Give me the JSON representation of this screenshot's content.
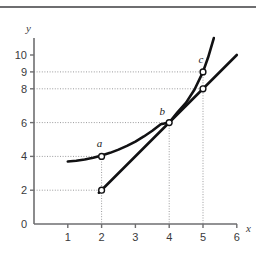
{
  "figure": {
    "title": "",
    "caption": ""
  },
  "chart_data": {
    "type": "line",
    "title": "",
    "subtitle": "",
    "xlabel": "x",
    "ylabel": "y",
    "xlim": [
      0,
      6.6
    ],
    "ylim": [
      0,
      11.2
    ],
    "grid": "dotted-guidelines-to-marked-points",
    "legend": "none",
    "x_ticks": [
      {
        "value": 0,
        "label": "0"
      },
      {
        "value": 1,
        "label": "1"
      },
      {
        "value": 2,
        "label": "2"
      },
      {
        "value": 3,
        "label": "3"
      },
      {
        "value": 4,
        "label": "4"
      },
      {
        "value": 5,
        "label": "5"
      },
      {
        "value": 6,
        "label": "6"
      }
    ],
    "y_ticks": [
      {
        "value": 0,
        "label": "0"
      },
      {
        "value": 2,
        "label": "2"
      },
      {
        "value": 4,
        "label": "4"
      },
      {
        "value": 6,
        "label": "6"
      },
      {
        "value": 8,
        "label": "8"
      },
      {
        "value": 9,
        "label": "9"
      },
      {
        "value": 10,
        "label": "10"
      }
    ],
    "series": [
      {
        "name": "curve",
        "kind": "curve",
        "style": "solid-thick-black",
        "domain": [
          1.0,
          5.32
        ],
        "points": [
          {
            "x": 1.0,
            "y": 3.7
          },
          {
            "x": 1.25,
            "y": 3.74
          },
          {
            "x": 1.5,
            "y": 3.82
          },
          {
            "x": 1.75,
            "y": 3.92
          },
          {
            "x": 2.0,
            "y": 4.05
          },
          {
            "x": 2.25,
            "y": 4.21
          },
          {
            "x": 2.5,
            "y": 4.4
          },
          {
            "x": 2.75,
            "y": 4.62
          },
          {
            "x": 3.0,
            "y": 4.88
          },
          {
            "x": 3.25,
            "y": 5.18
          },
          {
            "x": 3.5,
            "y": 5.52
          },
          {
            "x": 3.75,
            "y": 5.9
          },
          {
            "x": 4.0,
            "y": 6.0
          },
          {
            "x": 4.25,
            "y": 6.62
          },
          {
            "x": 4.5,
            "y": 7.18
          },
          {
            "x": 4.75,
            "y": 7.96
          },
          {
            "x": 5.0,
            "y": 9.0
          },
          {
            "x": 5.15,
            "y": 9.85
          },
          {
            "x": 5.32,
            "y": 11.0
          }
        ]
      },
      {
        "name": "secant-line",
        "kind": "line",
        "style": "solid-thick-black",
        "slope": 2,
        "endpoints": [
          {
            "x": 1.92,
            "y": 1.85
          },
          {
            "x": 6.0,
            "y": 10.0
          }
        ],
        "passes_through": [
          {
            "x": 2,
            "y": 2
          },
          {
            "x": 4,
            "y": 6
          },
          {
            "x": 5,
            "y": 8
          }
        ]
      }
    ],
    "marked_points": [
      {
        "id": "a",
        "label": "a",
        "x": 2,
        "y": 4,
        "marker": "open-circle",
        "on": "curve",
        "label_dx": -2,
        "label_dy": -9,
        "guides": {
          "horizontal_to_y_axis": true,
          "vertical_to_x_axis": true
        }
      },
      {
        "id": "b",
        "label": "b",
        "x": 4,
        "y": 6,
        "marker": "open-circle",
        "on": "curve-and-line",
        "label_dx": -7,
        "label_dy": -8,
        "guides": {
          "horizontal_to_y_axis": true,
          "vertical_to_x_axis": true
        }
      },
      {
        "id": "c",
        "label": "c",
        "x": 5,
        "y": 9,
        "marker": "open-circle",
        "on": "curve",
        "label_dx": -2,
        "label_dy": -9,
        "guides": {
          "horizontal_to_y_axis": true,
          "vertical_to_x_axis": true
        }
      },
      {
        "id": "p2",
        "label": "",
        "x": 2,
        "y": 2,
        "marker": "open-circle",
        "on": "line",
        "label_dx": 0,
        "label_dy": 0,
        "guides": {
          "horizontal_to_y_axis": true,
          "vertical_to_x_axis": false
        }
      },
      {
        "id": "p8",
        "label": "",
        "x": 5,
        "y": 8,
        "marker": "open-circle",
        "on": "line",
        "label_dx": 0,
        "label_dy": 0,
        "guides": {
          "horizontal_to_y_axis": true,
          "vertical_to_x_axis": false
        }
      }
    ],
    "guide_values": {
      "horizontal_y": [
        2,
        4,
        6,
        8,
        9
      ],
      "vertical_x": [
        2,
        4,
        5
      ]
    }
  },
  "colors": {
    "curve": "#111113",
    "line": "#111113",
    "axis": "#6e6e70",
    "guide": "#9a9a9c",
    "tick_text": "#3a3a3c",
    "top_rule": "#6e6e70",
    "background": "#ffffff",
    "marker_fill": "#ffffff"
  },
  "geometry": {
    "origin_px": {
      "x": 34,
      "y": 224
    },
    "px_per_unit_x": 33.8,
    "px_per_unit_y": 16.9,
    "x_axis_end_px": 237,
    "y_axis_top_px": 38
  }
}
